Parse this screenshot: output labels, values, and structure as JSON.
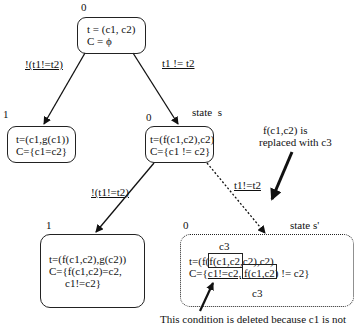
{
  "diagram": {
    "nodes": [
      {
        "id": "root",
        "state_index": "0",
        "lines": [
          "t = (c1, c2)",
          "C = ϕ"
        ]
      },
      {
        "id": "left1",
        "state_index": "1",
        "lines": [
          "t=(c1,g(c1))",
          "C={c1=c2}"
        ]
      },
      {
        "id": "s",
        "state_index": "0",
        "state_label": "state  s",
        "lines": [
          "t=(f(c1,c2),c2)",
          "C={c1 != c2}"
        ]
      },
      {
        "id": "left2",
        "state_index": "1",
        "lines": [
          "t=(f(c1,c2),g(c2))",
          "C={f(c1,c2)=c2,",
          "c1!=c2}"
        ]
      },
      {
        "id": "s_prime",
        "state_index": "0",
        "state_label": "state s'",
        "lines": [
          "t=(f(f(c1,c2),c2),c2)",
          "C={c1!=c2, f(c1,c2) != c2}"
        ],
        "box_labels": [
          "c3",
          "c3"
        ]
      }
    ],
    "edges": [
      {
        "from": "root",
        "to": "left1",
        "label": "!(t1!=t2)",
        "style": "solid"
      },
      {
        "from": "root",
        "to": "s",
        "label": "t1  != t2",
        "style": "solid"
      },
      {
        "from": "s",
        "to": "left2",
        "label": "!(t1!=t2)",
        "style": "solid"
      },
      {
        "from": "s",
        "to": "s_prime",
        "label": "t1!=t2",
        "style": "dotted"
      }
    ],
    "annotations": {
      "replace_note_line1": "f(c1,c2) is",
      "replace_note_line2": "replaced with c3",
      "delete_note": "This condition is deleted because c1 is not"
    },
    "s_prime_parts": {
      "t_prefix": "t=(f(",
      "t_boxed": "f(c1,c2",
      "t_suffix": ",c2),c2)",
      "c_prefix": "C={",
      "c_struck": "c1!=c2,",
      "c_boxed": "f(c1,c2",
      "c_suffix": ") != c2}",
      "top_c3": "c3",
      "bottom_c3": "c3"
    }
  }
}
